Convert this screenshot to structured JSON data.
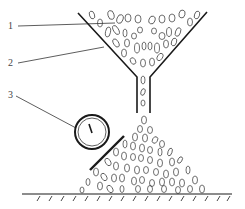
{
  "diagram": {
    "type": "schematic",
    "labels": [
      {
        "id": "1",
        "text": "1",
        "points_to": "granular material in funnel"
      },
      {
        "id": "2",
        "text": "2",
        "points_to": "funnel wall"
      },
      {
        "id": "3",
        "text": "3",
        "points_to": "circular gauge on slope"
      }
    ],
    "colors": {
      "line": "#1a1a1a",
      "background": "#ffffff",
      "label": "#444444"
    }
  }
}
